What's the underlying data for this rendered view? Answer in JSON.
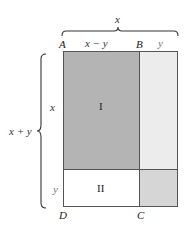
{
  "diagram": {
    "top_brace_label": "x",
    "side_brace_label": "x + y",
    "top_segments": [
      "x − y",
      "y"
    ],
    "side_segments": [
      "x",
      "y"
    ],
    "points": {
      "A": "A",
      "B": "B",
      "C": "C",
      "D": "D"
    },
    "regions": {
      "I": {
        "label": "I",
        "color": "#b4b4b4"
      },
      "II": {
        "label": "II",
        "color": "#ffffff"
      },
      "top_right": {
        "color": "#ececec"
      },
      "bottom_right": {
        "color": "#d6d6d6"
      }
    },
    "line_color": "#555555"
  }
}
